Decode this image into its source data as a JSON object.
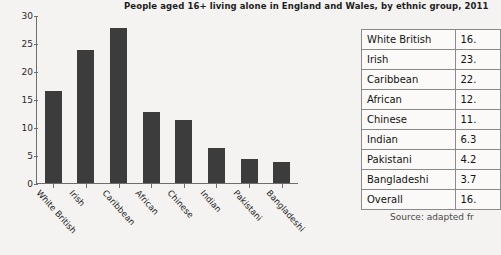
{
  "chart_data": {
    "type": "bar",
    "title": "People aged 16+ living alone in England and Wales, by ethnic group, 2011",
    "xlabel": "",
    "ylabel": "",
    "ylim": [
      0,
      30
    ],
    "yticks": [
      30,
      25,
      20,
      15,
      10,
      5,
      0
    ],
    "grid": false,
    "legend": "none",
    "bar_color": "#3c3c3c",
    "categories": [
      "White British",
      "Irish",
      "Caribbean",
      "African",
      "Chinese",
      "Indian",
      "Pakistani",
      "Bangladeshi"
    ],
    "values": [
      16.4,
      23.7,
      27.7,
      12.7,
      11.3,
      6.3,
      4.2,
      3.7
    ],
    "table": {
      "rows": [
        {
          "category": "White British",
          "value": "16."
        },
        {
          "category": "Irish",
          "value": "23."
        },
        {
          "category": "Caribbean",
          "value": "22."
        },
        {
          "category": "African",
          "value": "12."
        },
        {
          "category": "Chinese",
          "value": "11."
        },
        {
          "category": "Indian",
          "value": "6.3"
        },
        {
          "category": "Pakistani",
          "value": "4.2"
        },
        {
          "category": "Bangladeshi",
          "value": "3.7"
        },
        {
          "category": "Overall",
          "value": "16."
        }
      ]
    },
    "source_note": "Source: adapted fr"
  }
}
